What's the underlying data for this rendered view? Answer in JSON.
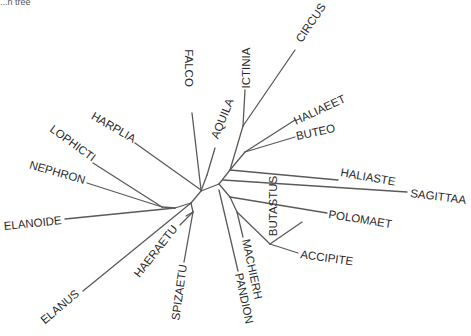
{
  "caption": "...n tree",
  "diagram": {
    "type": "unrooted phylogenetic tree",
    "line_color": "#5a5a5a",
    "label_color": "#2a2a2a",
    "taxa": [
      "FALCO",
      "ICTINIA",
      "CIRCUS",
      "AQUILA",
      "HALIAEET",
      "BUTEO",
      "HALIASTE",
      "SAGITTAA",
      "BUTASTUS",
      "POLOMAET",
      "ACCIPITE",
      "MACHIERH",
      "PANDION",
      "SPIZAETU",
      "HAERAETU",
      "ELANUS",
      "ELANOIDE",
      "NEPHRON",
      "LOPHICTI",
      "HARPLIA"
    ],
    "labels": {
      "falco": "FALCO",
      "ictinia": "ICTINIA",
      "circus": "CIRCUS",
      "aquila": "AQUILA",
      "haliaeet": "HALIAEET",
      "buteo": "BUTEO",
      "haliaste": "HALIASTE",
      "sagittaa": "SAGITTAA",
      "butastus": "BUTASTUS",
      "polomaet": "POLOMAET",
      "accipite": "ACCIPITE",
      "machierh": "MACHIERH",
      "pandion": "PANDION",
      "spizaetu": "SPIZAETU",
      "haeraetu": "HAERAETU",
      "elanus": "ELANUS",
      "elanoide": "ELANOIDE",
      "nephron": "NEPHRON",
      "lophicti": "LOPHICTI",
      "harplia": "HARPLIA"
    }
  }
}
